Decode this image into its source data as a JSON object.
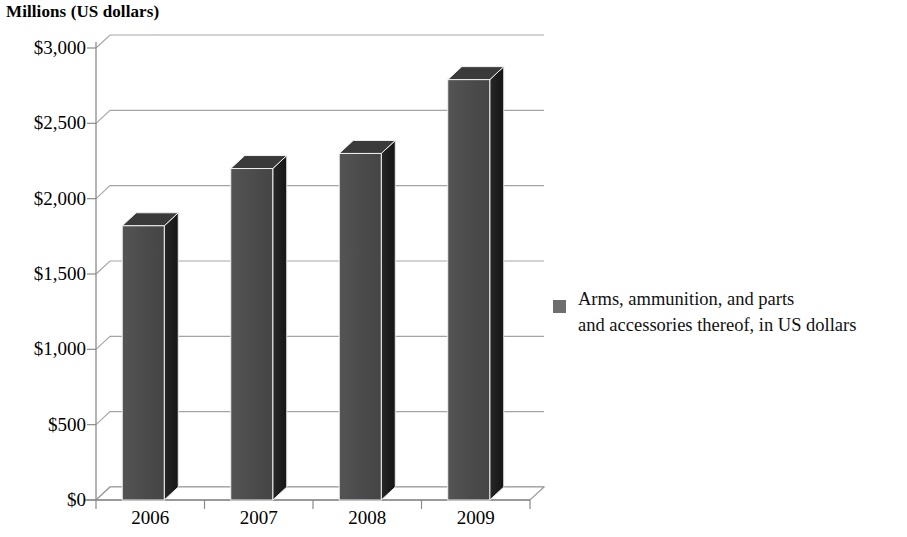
{
  "chart_data": {
    "type": "bar",
    "title": "Millions (US dollars)",
    "xlabel": "",
    "ylabel": "",
    "categories": [
      "2006",
      "2007",
      "2008",
      "2009"
    ],
    "values": [
      1820,
      2200,
      2300,
      2790
    ],
    "series": [
      {
        "name": "Arms, ammunition, and parts and accessories thereof, in US dollars",
        "values": [
          1820,
          2200,
          2300,
          2790
        ]
      }
    ],
    "ylim": [
      0,
      3000
    ],
    "ytick_values": [
      0,
      500,
      1000,
      1500,
      2000,
      2500,
      3000
    ],
    "ytick_labels": [
      "$0",
      "$500",
      "$1,000",
      "$1,500",
      "$2,000",
      "$2,500",
      "$3,000"
    ],
    "grid": true,
    "legend_position": "right",
    "style_3d": true,
    "colors": {
      "bar_front": "#4a4a4a",
      "bar_side": "#1c1c1c",
      "bar_top": "#3a3a3a",
      "legend_swatch": "#6e6e6e",
      "gridline": "#9a9a9a",
      "axis": "#8a8a8a",
      "text": "#000000"
    }
  },
  "legend": {
    "label": "Arms, ammunition, and parts\nand accessories thereof, in US dollars"
  }
}
